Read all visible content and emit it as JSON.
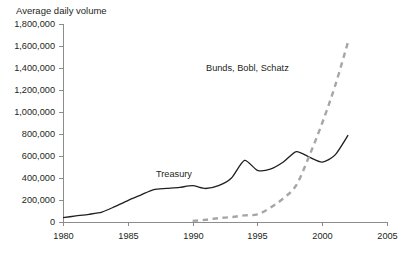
{
  "chart_data": {
    "type": "line",
    "title": "Average daily volume",
    "xlabel": "",
    "ylabel": "",
    "xlim": [
      1980,
      2005
    ],
    "ylim": [
      0,
      1800000
    ],
    "grid": false,
    "legend_position": "inline-annotation",
    "xticks": [
      "1980",
      "1985",
      "1990",
      "1995",
      "2000",
      "2005"
    ],
    "xtick_values": [
      1980,
      1985,
      1990,
      1995,
      2000,
      2005
    ],
    "yticks": [
      "0",
      "200,000",
      "400,000",
      "600,000",
      "800,000",
      "1,000,000",
      "1,200,000",
      "1,400,000",
      "1,600,000",
      "1,800,000"
    ],
    "ytick_values": [
      0,
      200000,
      400000,
      600000,
      800000,
      1000000,
      1200000,
      1400000,
      1600000,
      1800000
    ],
    "series": [
      {
        "name": "Treasury",
        "style": "solid",
        "color": "#231f20",
        "label_position": {
          "x": 1988.6,
          "y": 430000
        },
        "x": [
          1980,
          1981,
          1982,
          1983,
          1984,
          1985,
          1986,
          1987,
          1988,
          1989,
          1990,
          1991,
          1992,
          1993,
          1994,
          1995,
          1996,
          1997,
          1998,
          1999,
          2000,
          2001,
          2002
        ],
        "values": [
          40000,
          55000,
          70000,
          90000,
          140000,
          195000,
          245000,
          295000,
          305000,
          315000,
          330000,
          305000,
          330000,
          400000,
          560000,
          470000,
          480000,
          545000,
          640000,
          590000,
          545000,
          610000,
          790000
        ]
      },
      {
        "name": "Bunds, Bobl, Schatz",
        "style": "dashed",
        "color": "#a6a6a6",
        "label_position": {
          "x": 1994.2,
          "y": 1395000
        },
        "x": [
          1990,
          1991,
          1992,
          1993,
          1994,
          1995,
          1996,
          1997,
          1998,
          1999,
          2000,
          2001,
          2002
        ],
        "values": [
          10000,
          20000,
          35000,
          45000,
          60000,
          70000,
          130000,
          215000,
          335000,
          600000,
          900000,
          1240000,
          1640000
        ]
      }
    ],
    "annotations": [
      {
        "text": "Treasury",
        "x": 1988.6,
        "y": 430000
      },
      {
        "text": "Bunds, Bobl, Schatz",
        "x": 1994.2,
        "y": 1395000
      }
    ],
    "axis_color": "#8c8c8c"
  }
}
